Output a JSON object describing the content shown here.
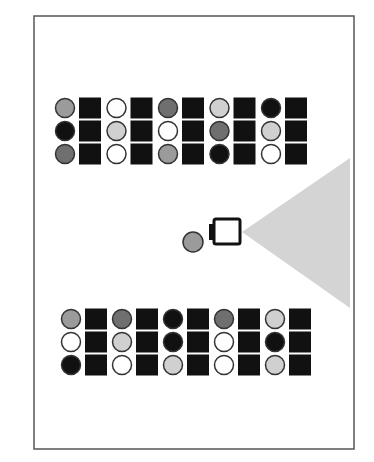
{
  "diagram": {
    "palette": {
      "black": "#111111",
      "dark": "#6f6f6f",
      "mid": "#9b9b9b",
      "light": "#d0d0d0",
      "white": "#ffffff",
      "square": "#111111",
      "outline": "#333333",
      "cone": "#d4d4d4",
      "frame": "#555555"
    },
    "frame": {
      "x": 34,
      "y": 16,
      "w": 320,
      "h": 433
    },
    "shelves": [
      {
        "name": "top-shelf",
        "x0": 65,
        "y0": 108,
        "col_pitch": 51.5,
        "row_pitch": 23,
        "circles": [
          [
            "mid",
            "white",
            "dark",
            "light",
            "black"
          ],
          [
            "black",
            "light",
            "white",
            "dark",
            "light"
          ],
          [
            "dark",
            "white",
            "mid",
            "black",
            "white"
          ]
        ]
      },
      {
        "name": "bottom-shelf",
        "x0": 71,
        "y0": 319,
        "col_pitch": 51,
        "row_pitch": 23,
        "circles": [
          [
            "mid",
            "dark",
            "black",
            "dark",
            "light"
          ],
          [
            "white",
            "light",
            "black",
            "white",
            "black"
          ],
          [
            "black",
            "white",
            "light",
            "white",
            "light"
          ]
        ]
      }
    ],
    "robot": {
      "x": 214,
      "y": 219,
      "w": 26,
      "h": 25,
      "tab": {
        "x": 209,
        "y": 224,
        "w": 7,
        "h": 16
      }
    },
    "object": {
      "cx": 193,
      "cy": 242,
      "r": 10,
      "color": "mid"
    },
    "camera_cone": {
      "apex": [
        242,
        232
      ],
      "far_top": [
        350,
        158
      ],
      "far_bottom": [
        350,
        308
      ]
    }
  }
}
